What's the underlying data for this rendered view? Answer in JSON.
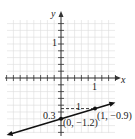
{
  "chart_data": {
    "type": "line",
    "title": "",
    "xlabel": "x",
    "ylabel": "y",
    "xlim": [
      -1.6,
      1.6
    ],
    "ylim": [
      -1.6,
      1.7
    ],
    "grid": true,
    "grid_step": 0.2,
    "tick_labels": {
      "x": [
        "1"
      ],
      "y": [
        "1"
      ]
    },
    "series": [
      {
        "name": "line",
        "x": [
          -1.6,
          1.6
        ],
        "y": [
          -1.68,
          -0.72
        ],
        "slope": 0.3,
        "intercept": -1.2
      }
    ],
    "points": [
      {
        "x": 0,
        "y": -1.2,
        "label": "(0, −1.2)"
      },
      {
        "x": 1,
        "y": -0.9,
        "label": "(1, −0.9)"
      }
    ],
    "annotations": [
      {
        "text": "1",
        "meaning": "run"
      },
      {
        "text": "0.3",
        "meaning": "rise"
      }
    ]
  },
  "labels": {
    "x_axis": "x",
    "y_axis": "y",
    "x_tick": "1",
    "y_tick": "1",
    "run": "1",
    "rise": "0.3",
    "p1": "(0, −1.2)",
    "p2": "(1, −0.9)"
  },
  "colors": {
    "grid": "#d9d9d9",
    "axis": "#333333",
    "line": "#111111"
  }
}
